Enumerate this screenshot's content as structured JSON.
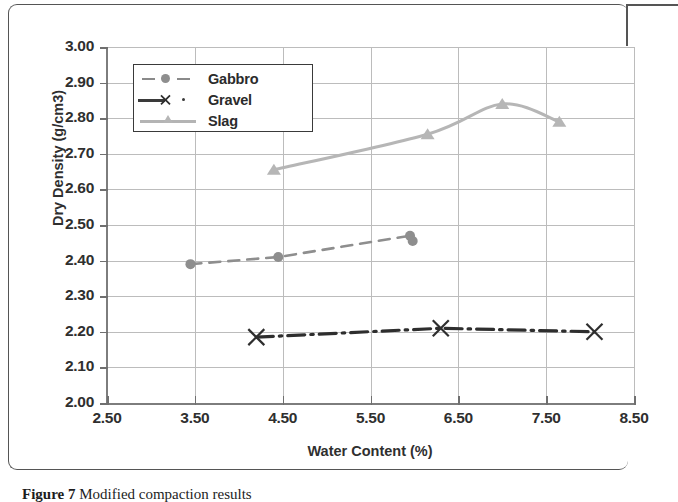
{
  "figure": {
    "caption_label": "Figure 7",
    "caption_text": " Modified compaction results"
  },
  "chart_data": {
    "type": "line",
    "title": "",
    "xlabel": "Water Content (%)",
    "ylabel": "Dry Density (g/cm3)",
    "xlim": [
      2.5,
      8.5
    ],
    "ylim": [
      2.0,
      3.0
    ],
    "xticks": [
      "2.50",
      "3.50",
      "4.50",
      "5.50",
      "6.50",
      "7.50",
      "8.50"
    ],
    "yticks": [
      "2.00",
      "2.10",
      "2.20",
      "2.30",
      "2.40",
      "2.50",
      "2.60",
      "2.70",
      "2.80",
      "2.90",
      "3.00"
    ],
    "grid": true,
    "legend_position": "upper-left-inside",
    "series": [
      {
        "name": "Gabbro",
        "marker": "circle",
        "linestyle": "dashed",
        "color": "#8e8e8e",
        "x": [
          3.45,
          4.45,
          5.95,
          5.98
        ],
        "y": [
          2.39,
          2.41,
          2.47,
          2.455
        ]
      },
      {
        "name": "Gravel",
        "marker": "x",
        "linestyle": "dash-dot",
        "color": "#2e2e2e",
        "x": [
          4.2,
          6.3,
          8.05
        ],
        "y": [
          2.185,
          2.21,
          2.2
        ]
      },
      {
        "name": "Slag",
        "marker": "triangle",
        "linestyle": "solid",
        "color": "#b6b6b6",
        "x": [
          4.4,
          6.15,
          7.0,
          7.65
        ],
        "y": [
          2.655,
          2.755,
          2.84,
          2.79
        ]
      }
    ]
  },
  "legend": {
    "items": [
      {
        "label": "Gabbro"
      },
      {
        "label": "Gravel"
      },
      {
        "label": "Slag"
      }
    ]
  }
}
